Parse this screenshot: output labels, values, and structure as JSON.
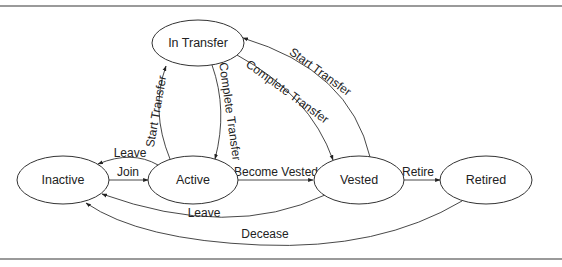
{
  "diagram": {
    "type": "state-machine",
    "nodes": [
      {
        "id": "in_transfer",
        "label": "In Transfer"
      },
      {
        "id": "inactive",
        "label": "Inactive"
      },
      {
        "id": "active",
        "label": "Active"
      },
      {
        "id": "vested",
        "label": "Vested"
      },
      {
        "id": "retired",
        "label": "Retired"
      }
    ],
    "edges": [
      {
        "from": "inactive",
        "to": "active",
        "label": "Join"
      },
      {
        "from": "active",
        "to": "inactive",
        "label": "Leave"
      },
      {
        "from": "active",
        "to": "in_transfer",
        "label": "Start Transfer"
      },
      {
        "from": "in_transfer",
        "to": "active",
        "label": "Complete Transfer"
      },
      {
        "from": "active",
        "to": "vested",
        "label": "Become Vested"
      },
      {
        "from": "in_transfer",
        "to": "vested",
        "label": "Complete Transfer"
      },
      {
        "from": "vested",
        "to": "in_transfer",
        "label": "Start Transfer"
      },
      {
        "from": "vested",
        "to": "retired",
        "label": "Retire"
      },
      {
        "from": "vested",
        "to": "inactive",
        "label": "Leave"
      },
      {
        "from": "retired",
        "to": "inactive",
        "label": "Decease"
      }
    ]
  },
  "colors": {
    "stroke": "#333333",
    "frame": "#9a9a9a",
    "background": "#ffffff"
  }
}
